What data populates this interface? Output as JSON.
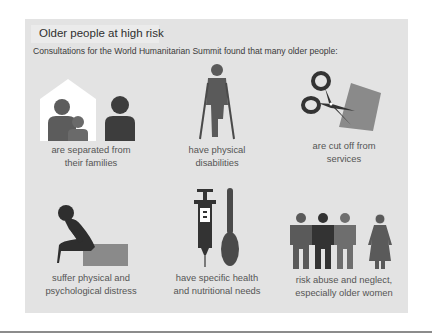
{
  "panel": {
    "title": "Older people at high risk",
    "subtitle": "Consultations for the World Humanitarian Summit found that many older people:",
    "background": "#e3e3e3"
  },
  "items": [
    {
      "icon": "family-separated-icon",
      "line1": "are separated from",
      "line2": "their families"
    },
    {
      "icon": "person-on-crutches-icon",
      "line1": "have physical",
      "line2": "disabilities"
    },
    {
      "icon": "scissors-cutting-paper-icon",
      "line1": "are cut off from",
      "line2": "services"
    },
    {
      "icon": "distressed-person-icon",
      "line1": "suffer physical and",
      "line2": "psychological distress"
    },
    {
      "icon": "syringe-and-spoon-icon",
      "line1": "have specific health",
      "line2": "and nutritional needs"
    },
    {
      "icon": "men-and-older-woman-icon",
      "line1": "risk abuse and neglect,",
      "line2": "especially older women"
    }
  ],
  "colors": {
    "figure_dark": "#3d3d3d",
    "figure_mid": "#5a5a5a",
    "figure_light": "#6e6e6e",
    "accent_gray": "#8a8a8a",
    "text": "#555555"
  }
}
